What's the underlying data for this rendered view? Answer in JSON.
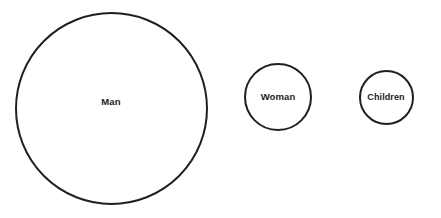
{
  "diagram": {
    "type": "proportional-circle-diagram",
    "background_color": "#ffffff",
    "stroke_color": "#231f20",
    "label_color": "#1c1c1c",
    "bubbles": [
      {
        "id": "man",
        "label": "Man",
        "center_x": 111,
        "center_y": 108,
        "diameter": 193,
        "stroke_width": 2.1
      },
      {
        "id": "woman",
        "label": "Woman",
        "center_x": 278,
        "center_y": 97,
        "diameter": 68,
        "stroke_width": 2
      },
      {
        "id": "children",
        "label": "Children",
        "center_x": 386,
        "center_y": 97,
        "diameter": 55,
        "stroke_width": 2
      }
    ]
  },
  "chart_data": {
    "type": "bubble",
    "title": "",
    "xlabel": "",
    "ylabel": "",
    "categories": [
      "Man",
      "Woman",
      "Children"
    ],
    "values": [
      193,
      68,
      55
    ],
    "value_unit": "circle diameter (px)",
    "areas": [
      29255,
      3632,
      2376
    ],
    "legend": [],
    "grid": false,
    "annotations": []
  }
}
